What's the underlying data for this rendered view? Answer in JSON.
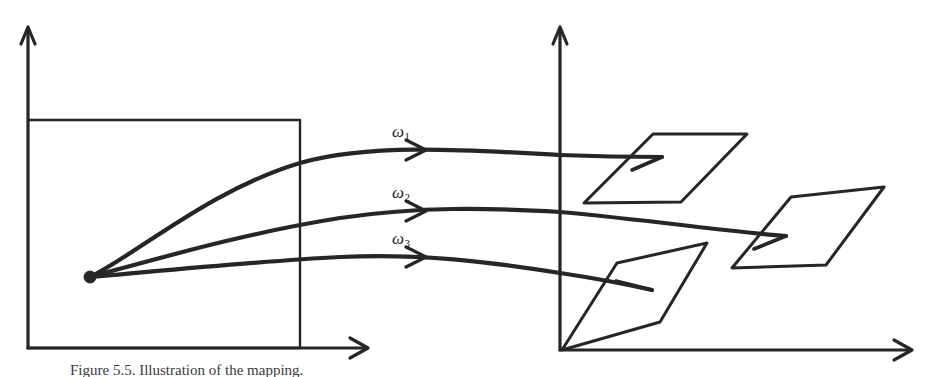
{
  "figure": {
    "background_color": "#ffffff",
    "stroke_color": "#262626",
    "width": 932,
    "height": 377,
    "caption": "Figure 5.5.  Illustration of the mapping."
  },
  "left_system": {
    "name": "source-coordinate-system",
    "origin": [
      28,
      348
    ],
    "y_axis": {
      "from": [
        28,
        348
      ],
      "to": [
        28,
        28
      ]
    },
    "x_axis": {
      "from": [
        28,
        348
      ],
      "to": [
        368,
        348
      ]
    },
    "region_box": {
      "x": 28,
      "y": 120,
      "width": 272,
      "height": 228
    },
    "source_point": {
      "cx": 90,
      "cy": 277,
      "r": 6
    }
  },
  "right_system": {
    "name": "target-coordinate-system",
    "origin": [
      560,
      350
    ],
    "y_axis": {
      "from": [
        560,
        350
      ],
      "to": [
        560,
        28
      ]
    },
    "x_axis": {
      "from": [
        560,
        350
      ],
      "to": [
        912,
        350
      ]
    }
  },
  "trajectories": [
    {
      "id": "omega-1",
      "label": "ω",
      "subscript": "1",
      "label_pos": [
        396,
        122
      ],
      "arrow_at": [
        424,
        150
      ],
      "path": "M 90,277 C 140,252 210,190 300,163 C 370,143 470,150 560,155 C 610,157 640,157 662,157",
      "end_stub": {
        "from": [
          630,
          170
        ],
        "to": [
          662,
          157
        ]
      }
    },
    {
      "id": "omega-2",
      "label": "ω",
      "subscript": "2",
      "label_pos": [
        396,
        183
      ],
      "arrow_at": [
        424,
        211
      ],
      "path": "M 90,277 C 160,258 250,232 340,218 C 420,206 490,208 560,212 C 650,220 730,232 786,236",
      "end_stub": {
        "from": [
          752,
          249
        ],
        "to": [
          786,
          236
        ]
      }
    },
    {
      "id": "omega-3",
      "label": "ω",
      "subscript": "3",
      "label_pos": [
        396,
        229
      ],
      "arrow_at": [
        424,
        257
      ],
      "path": "M 90,277 C 170,270 260,261 340,257 C 420,253 490,262 560,273 C 600,279 630,285 652,290",
      "end_stub": {
        "from": [
          614,
          281
        ],
        "to": [
          652,
          290
        ]
      }
    }
  ],
  "parallelograms": [
    {
      "id": "target-patch-1",
      "points": "653,134 747,134 681,202 584,203"
    },
    {
      "id": "target-patch-2",
      "points": "791,197 884,187 826,265 732,268"
    },
    {
      "id": "target-patch-3",
      "points": "617,263 707,243 660,322 562,350"
    }
  ],
  "arrowheads": [
    {
      "id": "left-y-axis-arrowhead",
      "points": "21,44 28,27 35,44"
    },
    {
      "id": "left-x-axis-arrowhead",
      "points": "350,338 368,348 350,358"
    },
    {
      "id": "right-y-axis-arrowhead",
      "points": "553,44 560,27 567,44"
    },
    {
      "id": "right-x-axis-arrowhead",
      "points": "894,338 912,350 894,360"
    },
    {
      "id": "omega-1-arrowhead",
      "points": "406,140 426,150 406,160"
    },
    {
      "id": "omega-2-arrowhead",
      "points": "406,201 426,211 406,221"
    },
    {
      "id": "omega-3-arrowhead",
      "points": "406,247 426,257 406,267"
    }
  ]
}
